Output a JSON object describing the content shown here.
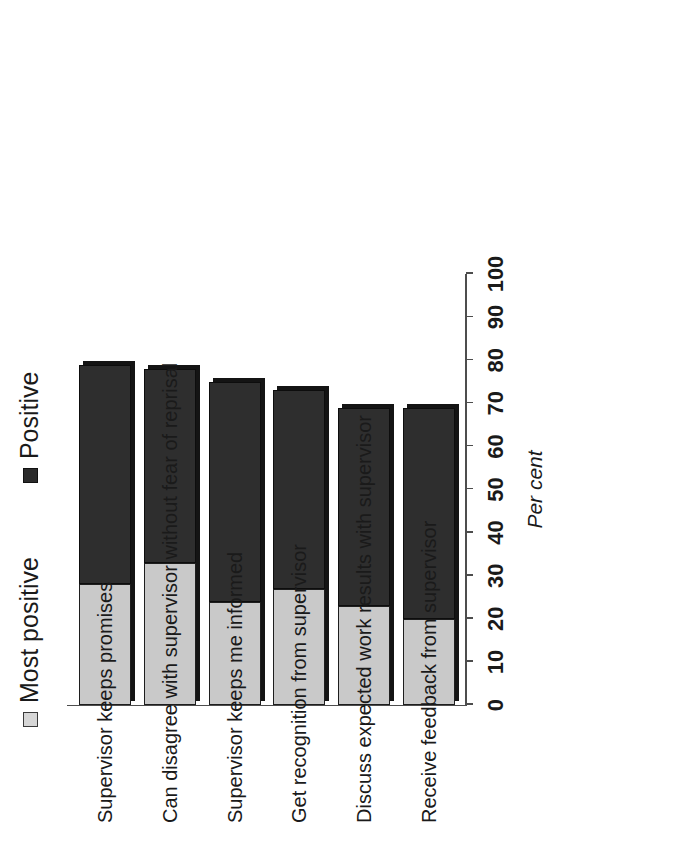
{
  "chart_data": {
    "type": "bar",
    "orientation": "horizontal-stacked",
    "title": "",
    "xlabel": "Per cent",
    "ylabel": "",
    "xlim": [
      0,
      100
    ],
    "grid": false,
    "legend_position": "top",
    "categories": [
      "Supervisor keeps promises",
      "Can disagree with supervisor without fear of reprisal",
      "Supervisor keeps me informed",
      "Get recognition from supervisor",
      "Discuss expected work results with supervisor",
      "Receive feedback from supervisor"
    ],
    "series": [
      {
        "name": "Most positive",
        "color": "#c9c9c9",
        "values": [
          28,
          33,
          24,
          27,
          23,
          20
        ]
      },
      {
        "name": "Positive",
        "color": "#2e2e2e",
        "values": [
          51,
          45,
          51,
          46,
          46,
          49
        ]
      }
    ],
    "totals": [
      79,
      78,
      75,
      73,
      69,
      69
    ],
    "tick_values": [
      0,
      10,
      20,
      30,
      40,
      50,
      60,
      70,
      80,
      90,
      100
    ],
    "tick_labels": [
      "0",
      "10",
      "20",
      "30",
      "40",
      "50",
      "60",
      "70",
      "80",
      "90",
      "100"
    ]
  },
  "legend": {
    "entries": [
      {
        "label": "Most positive",
        "swatch": "light-square-swatch-icon"
      },
      {
        "label": "Positive",
        "swatch": "dark-square-swatch-icon"
      }
    ]
  },
  "axis": {
    "title": "Per cent"
  }
}
